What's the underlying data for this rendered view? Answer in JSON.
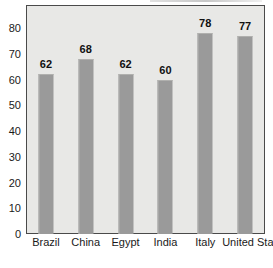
{
  "chart_data": {
    "type": "bar",
    "title": "",
    "xlabel": "",
    "ylabel": "",
    "categories": [
      "Brazil",
      "China",
      "Egypt",
      "India",
      "Italy",
      "United States"
    ],
    "values": [
      62,
      68,
      62,
      60,
      78,
      77
    ],
    "value_labels": [
      "62",
      "68",
      "62",
      "60",
      "78",
      "77"
    ],
    "ylim": [
      0,
      89
    ],
    "yticks": [
      0,
      10,
      20,
      30,
      40,
      50,
      60,
      70,
      80
    ],
    "ytick_labels": [
      "0",
      "10",
      "20",
      "30",
      "40",
      "50",
      "60",
      "70",
      "80"
    ],
    "grid": false,
    "legend": false,
    "colors": {
      "bar": "#9a9a9a",
      "plot_background": "#e8e8e6",
      "border": "#4a4a4a",
      "text": "#1a1a1a",
      "page_background": "#ffffff"
    }
  }
}
